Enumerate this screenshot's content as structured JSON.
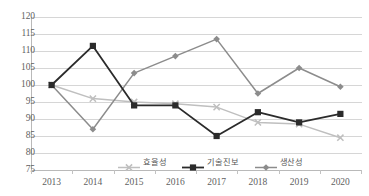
{
  "chart_data": {
    "type": "line",
    "title": "",
    "xlabel": "",
    "ylabel": "",
    "categories": [
      "2013",
      "2014",
      "2015",
      "2016",
      "2017",
      "2018",
      "2019",
      "2020"
    ],
    "ylim": [
      75,
      120
    ],
    "yticks": [
      120,
      115,
      110,
      105,
      100,
      95,
      90,
      85,
      80,
      75
    ],
    "grid": true,
    "legend_position": "bottom-center",
    "series": [
      {
        "name": "효율성",
        "color": "#bfbfbf",
        "marker": "x",
        "values": [
          100,
          96,
          95,
          94.5,
          93.5,
          89,
          88.5,
          84.5
        ]
      },
      {
        "name": "기술진보",
        "color": "#2b2b2b",
        "marker": "square",
        "values": [
          100,
          111.5,
          94,
          94,
          85,
          92,
          89,
          91.5
        ]
      },
      {
        "name": "생산성",
        "color": "#8c8c8c",
        "marker": "diamond",
        "values": [
          100,
          87,
          103.5,
          108.5,
          113.5,
          97.5,
          105,
          99.5
        ]
      }
    ]
  },
  "axis": {
    "y_tick_labels": [
      "120",
      "115",
      "110",
      "105",
      "100",
      "95",
      "90",
      "85",
      "80",
      "75"
    ],
    "x_tick_labels": [
      "2013",
      "2014",
      "2015",
      "2016",
      "2017",
      "2018",
      "2019",
      "2020"
    ]
  },
  "legend": {
    "items": [
      {
        "label": "효율성"
      },
      {
        "label": "기술진보"
      },
      {
        "label": "생산성"
      }
    ]
  }
}
